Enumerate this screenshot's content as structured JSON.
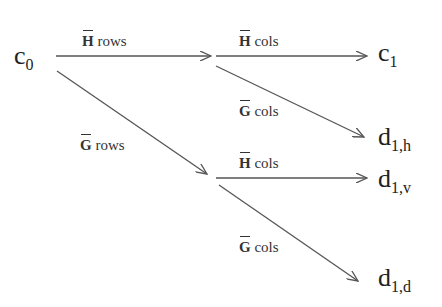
{
  "diagram": {
    "type": "wavelet-decomposition-flow",
    "nodes": {
      "c0": {
        "base": "c",
        "sub": "0"
      },
      "c1": {
        "base": "c",
        "sub": "1"
      },
      "d1h": {
        "base": "d",
        "sub": "1,h"
      },
      "d1v": {
        "base": "d",
        "sub": "1,v"
      },
      "d1d": {
        "base": "d",
        "sub": "1,d"
      }
    },
    "edges": [
      {
        "from": "c0",
        "to": "mid_top",
        "matrix": "H",
        "op": "rows"
      },
      {
        "from": "c0",
        "to": "mid_bottom",
        "matrix": "G",
        "op": "rows"
      },
      {
        "from": "mid_top",
        "to": "c1",
        "matrix": "H",
        "op": "cols"
      },
      {
        "from": "mid_top",
        "to": "d1h",
        "matrix": "G",
        "op": "cols"
      },
      {
        "from": "mid_bottom",
        "to": "d1v",
        "matrix": "H",
        "op": "cols"
      },
      {
        "from": "mid_bottom",
        "to": "d1d",
        "matrix": "G",
        "op": "cols"
      }
    ],
    "colors": {
      "line": "#555555",
      "text": "#222222"
    }
  }
}
